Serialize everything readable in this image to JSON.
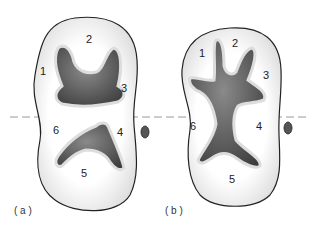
{
  "diagram": {
    "figures": [
      {
        "caption": "( a )",
        "regions": [
          {
            "id": "1",
            "label": "1"
          },
          {
            "id": "2",
            "label": "2"
          },
          {
            "id": "3",
            "label": "3"
          },
          {
            "id": "4",
            "label": "4"
          },
          {
            "id": "5",
            "label": "5"
          },
          {
            "id": "6",
            "label": "6"
          }
        ]
      },
      {
        "caption": "( b )",
        "regions": [
          {
            "id": "1",
            "label": "1"
          },
          {
            "id": "2",
            "label": "2"
          },
          {
            "id": "3",
            "label": "3"
          },
          {
            "id": "4",
            "label": "4"
          },
          {
            "id": "5",
            "label": "5"
          },
          {
            "id": "6",
            "label": "6"
          }
        ]
      }
    ],
    "colors": {
      "outline": "#222222",
      "cavity_dark": "#4a4a4a",
      "cavity_light": "#8a8a8a",
      "dashed_line": "#999999",
      "background": "#ffffff"
    }
  }
}
